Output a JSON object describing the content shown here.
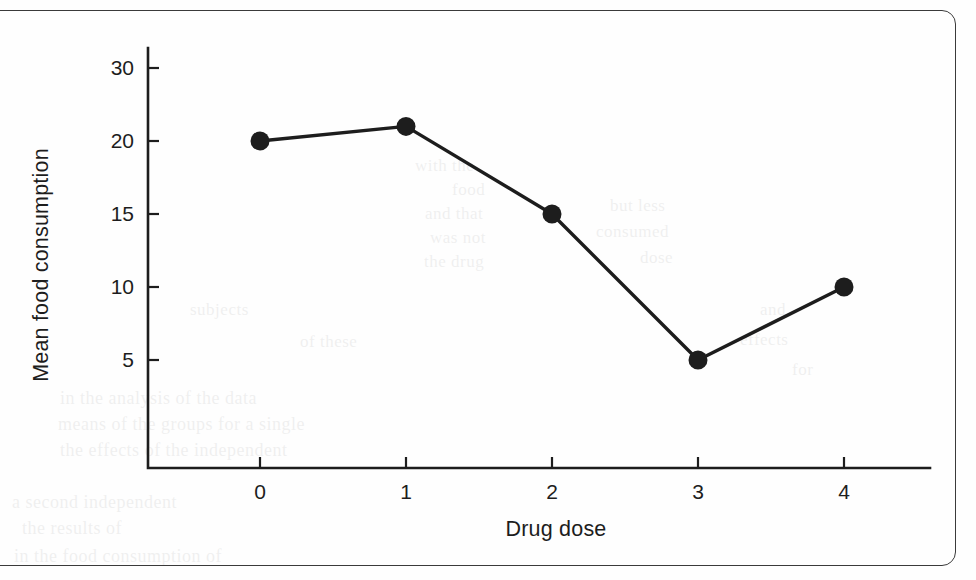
{
  "figure": {
    "frame_color": "#3a3a3a",
    "ink_color": "#1d1d1d",
    "background": "#fefefe"
  },
  "chart_data": {
    "type": "line",
    "title": "",
    "xlabel": "Drug dose",
    "ylabel": "Mean food consumption",
    "categories": [
      "0",
      "1",
      "2",
      "3",
      "4"
    ],
    "x": [
      0,
      1,
      2,
      3,
      4
    ],
    "values": [
      20,
      22,
      15,
      5,
      10
    ],
    "series": [
      {
        "name": "Mean food consumption",
        "values": [
          20,
          22,
          15,
          5,
          10
        ],
        "marker": "filled-circle",
        "marker_color": "#1d1d1d",
        "line_color": "#1d1d1d"
      }
    ],
    "xtick_labels": [
      "0",
      "1",
      "2",
      "3",
      "4"
    ],
    "ytick_labels": [
      "30",
      "20",
      "15",
      "10",
      "5"
    ],
    "ytick_values": [
      30,
      20,
      15,
      10,
      5
    ],
    "grid": false,
    "legend": "none"
  },
  "bleed_text": [
    {
      "t": "with the",
      "x": 415,
      "y": 156,
      "s": 17
    },
    {
      "t": "food",
      "x": 452,
      "y": 180,
      "s": 17
    },
    {
      "t": "and that",
      "x": 425,
      "y": 204,
      "s": 17
    },
    {
      "t": "was not",
      "x": 430,
      "y": 228,
      "s": 17
    },
    {
      "t": "the drug",
      "x": 424,
      "y": 252,
      "s": 17
    },
    {
      "t": "but less",
      "x": 610,
      "y": 196,
      "s": 17
    },
    {
      "t": "consumed",
      "x": 596,
      "y": 222,
      "s": 17
    },
    {
      "t": "dose",
      "x": 640,
      "y": 248,
      "s": 17
    },
    {
      "t": "subjects",
      "x": 190,
      "y": 300,
      "s": 17
    },
    {
      "t": "of these",
      "x": 300,
      "y": 332,
      "s": 17
    },
    {
      "t": "in the analysis of the data",
      "x": 60,
      "y": 388,
      "s": 18
    },
    {
      "t": "means of the groups for a single",
      "x": 58,
      "y": 414,
      "s": 18
    },
    {
      "t": "the effects of the independent",
      "x": 60,
      "y": 440,
      "s": 18
    },
    {
      "t": "a second independent",
      "x": 12,
      "y": 492,
      "s": 18
    },
    {
      "t": "the results of",
      "x": 22,
      "y": 518,
      "s": 18
    },
    {
      "t": "in the food consumption of",
      "x": 14,
      "y": 546,
      "s": 18
    },
    {
      "t": "and",
      "x": 760,
      "y": 300,
      "s": 17
    },
    {
      "t": "effects",
      "x": 740,
      "y": 330,
      "s": 17
    },
    {
      "t": "for",
      "x": 792,
      "y": 360,
      "s": 17
    }
  ]
}
